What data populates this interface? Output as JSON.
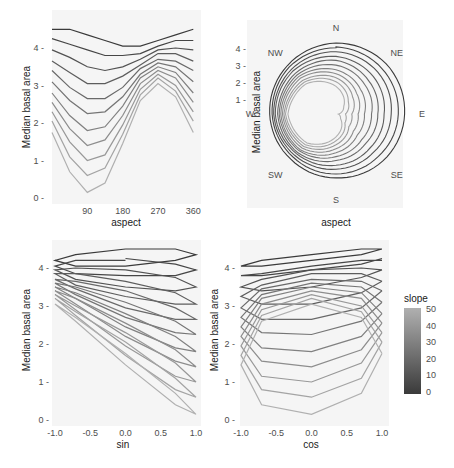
{
  "chart_data": [
    {
      "type": "line",
      "panel": "top-left",
      "title": "",
      "xlabel": "aspect",
      "ylabel": "Median basal area",
      "x": [
        0,
        45,
        90,
        135,
        180,
        225,
        270,
        315,
        360
      ],
      "xticks": [
        "90",
        "180",
        "270",
        "360"
      ],
      "xtick_values": [
        90,
        180,
        270,
        360
      ],
      "yticks": [
        "0",
        "1",
        "2",
        "3",
        "4"
      ],
      "xlim": [
        0,
        360
      ],
      "ylim": [
        0,
        4.6
      ],
      "grid": false,
      "series": [
        {
          "name": "slope 0",
          "slope": 0,
          "values": [
            4.5,
            4.5,
            4.35,
            4.2,
            4.05,
            4.05,
            4.2,
            4.35,
            4.5
          ]
        },
        {
          "name": "slope 5",
          "slope": 5,
          "values": [
            4.25,
            4.1,
            3.95,
            3.8,
            3.8,
            3.85,
            4.05,
            4.2,
            4.2
          ]
        },
        {
          "name": "slope 10",
          "slope": 10,
          "values": [
            3.95,
            3.75,
            3.5,
            3.4,
            3.5,
            3.7,
            3.95,
            4.0,
            3.95
          ]
        },
        {
          "name": "slope 15",
          "slope": 15,
          "values": [
            3.65,
            3.35,
            3.05,
            3.05,
            3.25,
            3.55,
            3.85,
            3.85,
            3.65
          ]
        },
        {
          "name": "slope 20",
          "slope": 20,
          "values": [
            3.4,
            2.95,
            2.65,
            2.65,
            2.95,
            3.45,
            3.7,
            3.65,
            3.4
          ]
        },
        {
          "name": "slope 25",
          "slope": 25,
          "values": [
            3.1,
            2.6,
            2.25,
            2.3,
            2.7,
            3.3,
            3.6,
            3.5,
            3.1
          ]
        },
        {
          "name": "slope 30",
          "slope": 30,
          "values": [
            2.8,
            2.2,
            1.8,
            1.9,
            2.45,
            3.2,
            3.5,
            3.35,
            2.8
          ]
        },
        {
          "name": "slope 35",
          "slope": 35,
          "values": [
            2.55,
            1.85,
            1.4,
            1.55,
            2.2,
            3.05,
            3.4,
            3.2,
            2.55
          ]
        },
        {
          "name": "slope 40",
          "slope": 40,
          "values": [
            2.3,
            1.5,
            1.0,
            1.15,
            1.95,
            2.9,
            3.3,
            3.0,
            2.3
          ]
        },
        {
          "name": "slope 45",
          "slope": 45,
          "values": [
            2.05,
            1.1,
            0.6,
            0.8,
            1.7,
            2.75,
            3.2,
            2.85,
            2.05
          ]
        },
        {
          "name": "slope 50",
          "slope": 50,
          "values": [
            1.75,
            0.7,
            0.15,
            0.4,
            1.45,
            2.6,
            3.05,
            2.7,
            1.75
          ]
        }
      ]
    },
    {
      "type": "line",
      "panel": "top-right",
      "coord": "polar",
      "title": "",
      "xlabel": "aspect",
      "ylabel": "Median basal area",
      "angular_labels": [
        "N",
        "NE",
        "E",
        "SE",
        "S",
        "SW",
        "W",
        "NW"
      ],
      "yticks": [
        "1",
        "2",
        "3",
        "4"
      ],
      "note": "Same series as top-left panel plotted in polar coordinates (aspect as angle, median basal area as radius)"
    },
    {
      "type": "line",
      "panel": "bottom-left",
      "title": "",
      "xlabel": "sin",
      "ylabel": "Median basal area",
      "xticks": [
        "-1.0",
        "-0.5",
        "0.0",
        "0.5",
        "1.0"
      ],
      "yticks": [
        "0",
        "1",
        "2",
        "3",
        "4"
      ],
      "xlim": [
        -1,
        1
      ],
      "ylim": [
        0,
        4.6
      ],
      "note": "Same series as top-left panel plotted against sin(aspect)"
    },
    {
      "type": "line",
      "panel": "bottom-right",
      "title": "",
      "xlabel": "cos",
      "ylabel": "",
      "xticks": [
        "-1.0",
        "-0.5",
        "0.0",
        "0.5",
        "1.0"
      ],
      "yticks": [
        "0",
        "1",
        "2",
        "3",
        "4"
      ],
      "xlim": [
        -1,
        1
      ],
      "ylim": [
        0,
        4.6
      ],
      "note": "Same series as top-left panel plotted against cos(aspect)"
    }
  ],
  "legend": {
    "title": "slope",
    "labels": [
      "50",
      "40",
      "30",
      "20",
      "10",
      "0"
    ],
    "color_low": "#3a3a3a",
    "color_high": "#b0b0b0",
    "position": "right"
  },
  "labels": {
    "ylabel": "Median basal area",
    "aspect": "aspect",
    "sin": "sin",
    "cos": "cos",
    "compass": [
      "N",
      "NE",
      "E",
      "SE",
      "S",
      "SW",
      "W",
      "NW"
    ]
  },
  "colors": {
    "panel_bg": "#f5f5f5",
    "line_dark": "#3a3a3a",
    "line_light": "#b0b0b0"
  }
}
